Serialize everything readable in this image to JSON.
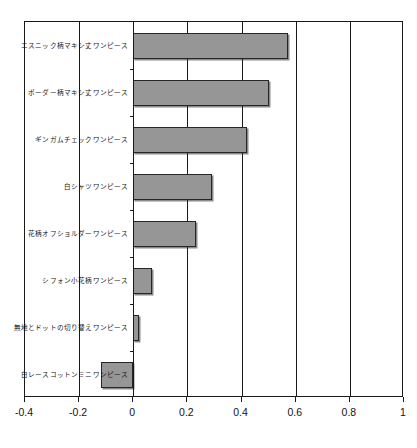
{
  "chart_data": {
    "type": "bar",
    "orientation": "horizontal",
    "title": "",
    "subtitle": "",
    "xlabel": "",
    "ylabel": "",
    "categories": [
      "エスニック柄マキシ丈ワンピース",
      "ボーダー柄マキシ丈ワンピース",
      "ギンガムチェックワンピース",
      "白シャツワンピース",
      "花柄オフショルダーワンピース",
      "シフォン小花柄ワンピース",
      "無地とドットの切り替えワンピース",
      "白レースコットンミニワンピース"
    ],
    "values": [
      0.57,
      0.5,
      0.42,
      0.29,
      0.23,
      0.07,
      0.02,
      -0.12
    ],
    "xlim": [
      -0.4,
      1.0
    ],
    "xticks": [
      -0.4,
      -0.2,
      0,
      0.2,
      0.4,
      0.6,
      0.8,
      1
    ],
    "xtick_labels": [
      "-0.4",
      "-0.2",
      "0",
      "0.2",
      "0.4",
      "0.6",
      "0.8",
      "1"
    ],
    "grid": true,
    "gridlines_at": [
      -0.2,
      0,
      0.2,
      0.4,
      0.6,
      0.8
    ],
    "legend": null,
    "legend_position": "none",
    "bar_color": "#969696",
    "bar_edge_color": "#262626",
    "axis_color": "#1a1a1a",
    "background_color": "#ffffff"
  }
}
